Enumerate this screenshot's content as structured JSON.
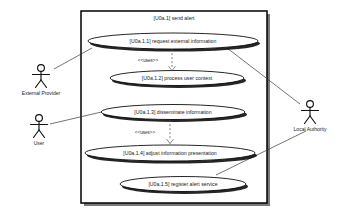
{
  "diagram": {
    "kind": "uml-use-case-diagram",
    "system": {
      "title": "[U0a.1] send alert"
    },
    "use_cases": [
      {
        "id": "uc-1",
        "label": "[U0a.1.1] request external information",
        "cx": 173,
        "cy": 41,
        "rx": 85,
        "ry": 8
      },
      {
        "id": "uc-2",
        "label": "[U0a.1.2] process user context",
        "cx": 177,
        "cy": 78,
        "rx": 67,
        "ry": 7.5
      },
      {
        "id": "uc-3",
        "label": "[U0a.1.3] disseminate information",
        "cx": 173,
        "cy": 112,
        "rx": 72,
        "ry": 7.5
      },
      {
        "id": "uc-4",
        "label": "[U0a.1.4] adjust information presentation",
        "cx": 170,
        "cy": 153,
        "rx": 85,
        "ry": 8
      },
      {
        "id": "uc-5",
        "label": "[U0a.1.5] register alert service",
        "cx": 183,
        "cy": 184,
        "rx": 63,
        "ry": 7.5
      }
    ],
    "actors": [
      {
        "id": "actor-external-provider",
        "label": "External Provider",
        "x": 41,
        "y": 72
      },
      {
        "id": "actor-user",
        "label": "User",
        "x": 39,
        "y": 122
      },
      {
        "id": "actor-local-authority",
        "label": "Local Authority",
        "x": 310,
        "y": 108
      }
    ],
    "relationships": [
      {
        "id": "rel-uses-1",
        "type": "uses",
        "stereotype": "<<uses>>",
        "from": "uc-1",
        "to": "uc-2"
      },
      {
        "id": "rel-uses-2",
        "type": "uses",
        "stereotype": "<<uses>>",
        "from": "uc-3",
        "to": "uc-4"
      },
      {
        "id": "rel-assoc-1",
        "type": "association",
        "from": "actor-external-provider",
        "to": "uc-1"
      },
      {
        "id": "rel-assoc-2",
        "type": "association",
        "from": "actor-local-authority",
        "to": "uc-1"
      },
      {
        "id": "rel-assoc-3",
        "type": "association",
        "from": "actor-user",
        "to": "uc-3"
      },
      {
        "id": "rel-assoc-4",
        "type": "association",
        "from": "actor-local-authority",
        "to": "uc-5"
      }
    ],
    "stereotype_labels": [
      {
        "id": "stereo-1",
        "text": "<<uses>>",
        "x": 148,
        "y": 61
      },
      {
        "id": "stereo-2",
        "text": "<<uses>>",
        "x": 145,
        "y": 133
      }
    ],
    "colors": {
      "background": "#ffffff",
      "stroke": "#000000",
      "boundary_shadow": "#4d4d4d",
      "line": "#3a3a3a",
      "dashed_line": "#555555",
      "text": "#1a1a1a"
    }
  }
}
